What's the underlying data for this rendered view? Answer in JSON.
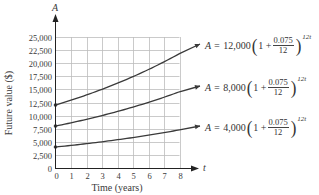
{
  "chart_data": {
    "type": "line",
    "title": "",
    "xlabel": "Time (years)",
    "ylabel": "Future value ($)",
    "x_axis_var": "t",
    "y_axis_var": "A",
    "xlim": [
      0,
      8
    ],
    "ylim": [
      0,
      25000
    ],
    "grid": true,
    "x_ticks": [
      "0",
      "1",
      "2",
      "3",
      "4",
      "5",
      "6",
      "7",
      "8"
    ],
    "y_ticks": [
      "0",
      "2,500",
      "5,000",
      "7,500",
      "10,000",
      "12,500",
      "15,000",
      "17,500",
      "20,000",
      "22,500",
      "25,000"
    ],
    "x": [
      0,
      1,
      2,
      3,
      4,
      5,
      6,
      7,
      8
    ],
    "series": [
      {
        "name": "A = 12,000(1 + 0.075/12)^(12t)",
        "principal": 12000,
        "rate": 0.075,
        "values": [
          12000,
          12933,
          13938,
          15022,
          16189,
          17448,
          18804,
          20265,
          21840
        ]
      },
      {
        "name": "A = 8,000(1 + 0.075/12)^(12t)",
        "principal": 8000,
        "rate": 0.075,
        "values": [
          8000,
          8622,
          9292,
          10015,
          10793,
          11632,
          12536,
          13510,
          14560
        ]
      },
      {
        "name": "A = 4,000(1 + 0.075/12)^(12t)",
        "principal": 4000,
        "rate": 0.075,
        "values": [
          4000,
          4311,
          4646,
          5007,
          5396,
          5816,
          6268,
          6755,
          7280
        ]
      }
    ],
    "annotations": [
      {
        "label_prefix": "A =",
        "coef": "12,000",
        "one_plus": "1 +",
        "num": "0.075",
        "den": "12",
        "exp": "12t"
      },
      {
        "label_prefix": "A =",
        "coef": "8,000",
        "one_plus": "1 +",
        "num": "0.075",
        "den": "12",
        "exp": "12t"
      },
      {
        "label_prefix": "A =",
        "coef": "4,000",
        "one_plus": "1 +",
        "num": "0.075",
        "den": "12",
        "exp": "12t"
      }
    ],
    "line_color": "#3a3a3a",
    "grid_color": "#bdbdbd"
  }
}
